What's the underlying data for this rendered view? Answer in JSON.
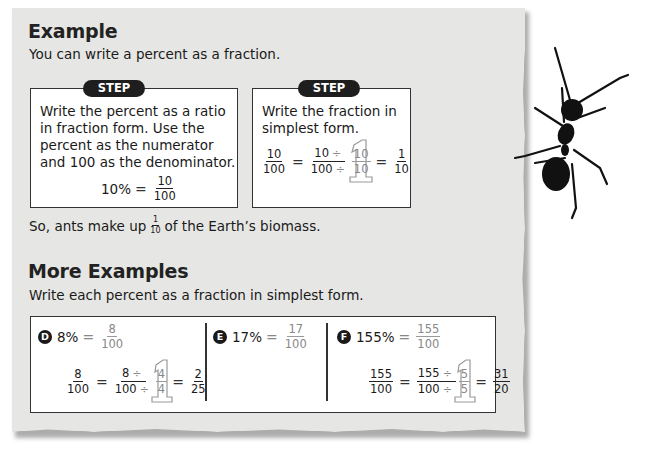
{
  "example": {
    "title": "Example",
    "intro": "You can write a percent as a fraction.",
    "step1": {
      "badge": "STEP 1",
      "lines": [
        "Write the percent as a ratio",
        "in fraction form. Use the",
        "percent as the numerator",
        "and 100 as the denominator."
      ],
      "equation": {
        "left": "10%",
        "eq": "=",
        "num": "10",
        "den": "100"
      }
    },
    "step2": {
      "badge": "STEP 2",
      "lines": [
        "Write the fraction in",
        "simplest form."
      ],
      "equation": {
        "f1": {
          "num": "10",
          "den": "100"
        },
        "eq1": "=",
        "f2": {
          "num": "10",
          "den": "100",
          "div": "÷"
        },
        "one": {
          "num": "10",
          "den": "10"
        },
        "eq2": "=",
        "f3": {
          "num": "1",
          "den": "10"
        }
      }
    },
    "conclusion": {
      "before": "So, ants make up",
      "frac_num": "1",
      "frac_den": "10",
      "after": "of the Earth’s biomass."
    }
  },
  "more_examples": {
    "title": "More Examples",
    "intro": "Write each percent as a fraction in simplest form.",
    "items": [
      {
        "letter": "D",
        "percent": "8%",
        "eq": "=",
        "num": "8",
        "den": "100",
        "work": {
          "f1": {
            "num": "8",
            "den": "100"
          },
          "f2": {
            "num": "8",
            "den": "100"
          },
          "div": "÷",
          "one": {
            "num": "4",
            "den": "4"
          },
          "result": {
            "num": "2",
            "den": "25"
          }
        }
      },
      {
        "letter": "E",
        "percent": "17%",
        "eq": "=",
        "num": "17",
        "den": "100"
      },
      {
        "letter": "F",
        "percent": "155%",
        "eq": "=",
        "num": "155",
        "den": "100",
        "work": {
          "f1": {
            "num": "155",
            "den": "100"
          },
          "f2": {
            "num": "155",
            "den": "100"
          },
          "div": "÷",
          "one": {
            "num": "5",
            "den": "5"
          },
          "result": {
            "num": "31",
            "den": "20"
          }
        }
      }
    ]
  },
  "colors": {
    "paper": "#e6e6e4",
    "ink": "#1a1a1a",
    "badge": "#1e1e1e",
    "work_gray": "#888888"
  },
  "image": {
    "icon": "ant-icon"
  }
}
